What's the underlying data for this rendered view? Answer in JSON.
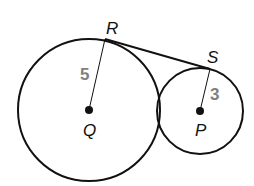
{
  "diagram": {
    "circles": [
      {
        "center_label": "Q",
        "radius_label": "5",
        "cx": 89,
        "cy": 110,
        "r": 71
      },
      {
        "center_label": "P",
        "radius_label": "3",
        "cx": 200,
        "cy": 111,
        "r": 43
      }
    ],
    "points": {
      "R": {
        "label": "R",
        "x": 105,
        "y": 39
      },
      "S": {
        "label": "S",
        "x": 210,
        "y": 69
      }
    },
    "segments": [
      "QR",
      "PS",
      "RS"
    ],
    "colors": {
      "stroke": "#111111",
      "radius_label": "#808080"
    }
  }
}
